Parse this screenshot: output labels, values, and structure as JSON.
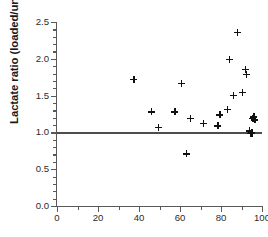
{
  "chart_data": {
    "type": "scatter",
    "title": "",
    "xlabel": "",
    "ylabel": "Lactate ratio (loaded/unloaded)",
    "xlim": [
      0,
      100
    ],
    "ylim": [
      0.0,
      2.5
    ],
    "xticks": [
      0,
      20,
      40,
      60,
      80,
      100
    ],
    "xtick_labels": [
      "0",
      "20",
      "40",
      "60",
      "80",
      "100"
    ],
    "xminor_ticks": [
      10,
      30,
      50,
      70,
      90
    ],
    "yticks": [
      0.0,
      0.5,
      1.0,
      1.5,
      2.0,
      2.5
    ],
    "ytick_labels": [
      "0.0",
      "0.5",
      "1.0",
      "1.5",
      "2.0",
      "2.5"
    ],
    "yminor_ticks": [
      0.1,
      0.2,
      0.3,
      0.4,
      0.6,
      0.7,
      0.8,
      0.9,
      1.1,
      1.2,
      1.3,
      1.4,
      1.6,
      1.7,
      1.8,
      1.9,
      2.1,
      2.2,
      2.3,
      2.4
    ],
    "grid": false,
    "legend": null,
    "marker": "plus",
    "marker_color": "#101010",
    "axis_color": "#595959",
    "reference_line": {
      "orientation": "horizontal",
      "y": 1.0,
      "x_start": 0,
      "x_end": 100,
      "color": "#4d4d4d"
    },
    "points": [
      {
        "x": 37.5,
        "y": 1.72
      },
      {
        "x": 46.0,
        "y": 1.28
      },
      {
        "x": 49.5,
        "y": 1.07
      },
      {
        "x": 57.5,
        "y": 1.28
      },
      {
        "x": 60.5,
        "y": 1.67
      },
      {
        "x": 63.0,
        "y": 0.71
      },
      {
        "x": 65.0,
        "y": 1.19
      },
      {
        "x": 71.5,
        "y": 1.12
      },
      {
        "x": 78.5,
        "y": 1.09
      },
      {
        "x": 79.5,
        "y": 1.24
      },
      {
        "x": 83.0,
        "y": 1.31
      },
      {
        "x": 84.0,
        "y": 1.99
      },
      {
        "x": 86.0,
        "y": 1.5
      },
      {
        "x": 88.0,
        "y": 2.36
      },
      {
        "x": 90.5,
        "y": 1.54
      },
      {
        "x": 92.0,
        "y": 1.86
      },
      {
        "x": 92.5,
        "y": 1.79
      },
      {
        "x": 94.0,
        "y": 1.02
      },
      {
        "x": 94.5,
        "y": 0.99
      },
      {
        "x": 95.0,
        "y": 0.99
      },
      {
        "x": 95.5,
        "y": 1.19
      },
      {
        "x": 96.0,
        "y": 1.21
      },
      {
        "x": 96.5,
        "y": 1.17
      },
      {
        "x": 95.0,
        "y": 1.0
      }
    ]
  }
}
